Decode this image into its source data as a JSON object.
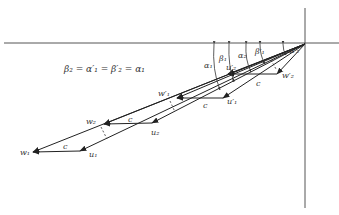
{
  "diagram": {
    "type": "velocity-triangles",
    "equation": "β₂ = α′₁ = β′₂ = α₁",
    "colors": {
      "line": "#222222",
      "axis": "#555555",
      "text": "#333333",
      "background": "#ffffff"
    },
    "labels": {
      "w1": "w₁",
      "u1": "u₁",
      "w2": "w₂",
      "u2": "u₂",
      "w1p": "w′₁",
      "u1p": "u′₁",
      "w2p": "w′₂",
      "u2p": "u′₂",
      "c": "c",
      "alpha1": "α₁",
      "beta1": "β₁",
      "alpha2": "α₂",
      "beta1p": "β′₁",
      "alpha2p": "α′₂"
    }
  }
}
